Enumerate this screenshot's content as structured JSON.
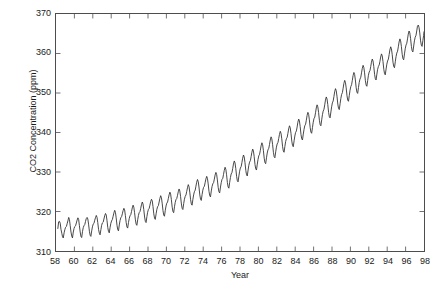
{
  "chart_data": {
    "type": "line",
    "title": "",
    "xlabel": "Year",
    "ylabel": "CO2 Concentration (ppm)",
    "xlim": [
      58,
      98
    ],
    "ylim": [
      310,
      370
    ],
    "xticks": [
      58,
      60,
      62,
      64,
      66,
      68,
      70,
      72,
      74,
      76,
      78,
      80,
      82,
      84,
      86,
      88,
      90,
      92,
      94,
      96,
      98
    ],
    "yticks": [
      310,
      320,
      330,
      340,
      350,
      360,
      370
    ],
    "grid": false,
    "legend": null,
    "line_color": "#333333",
    "line_width": 0.9,
    "series": [
      {
        "name": "CO2 Concentration",
        "x": [
          58.2,
          58.29,
          58.38,
          58.46,
          58.54,
          58.63,
          58.71,
          58.79,
          58.88,
          58.96,
          59.04,
          59.13,
          59.21,
          59.29,
          59.38,
          59.46,
          59.54,
          59.63,
          59.71,
          59.79,
          59.88,
          59.96,
          60.04,
          60.13,
          60.21,
          60.29,
          60.38,
          60.46,
          60.54,
          60.63,
          60.71,
          60.79,
          60.88,
          60.96,
          61.04,
          61.13,
          61.21,
          61.29,
          61.38,
          61.46,
          61.54,
          61.63,
          61.71,
          61.79,
          61.88,
          61.96,
          62.04,
          62.13,
          62.21,
          62.29,
          62.38,
          62.46,
          62.54,
          62.63,
          62.71,
          62.79,
          62.88,
          62.96,
          63.04,
          63.13,
          63.21,
          63.29,
          63.38,
          63.46,
          63.54,
          63.63,
          63.71,
          63.79,
          63.88,
          63.96,
          64.04,
          64.13,
          64.21,
          64.29,
          64.38,
          64.46,
          64.54,
          64.63,
          64.71,
          64.79,
          64.88,
          64.96,
          65.04,
          65.13,
          65.21,
          65.29,
          65.38,
          65.46,
          65.54,
          65.63,
          65.71,
          65.79,
          65.88,
          65.96,
          66.04,
          66.13,
          66.21,
          66.29,
          66.38,
          66.46,
          66.54,
          66.63,
          66.71,
          66.79,
          66.88,
          66.96,
          67.04,
          67.13,
          67.21,
          67.29,
          67.38,
          67.46,
          67.54,
          67.63,
          67.71,
          67.79,
          67.88,
          67.96,
          68.04,
          68.13,
          68.21,
          68.29,
          68.38,
          68.46,
          68.54,
          68.63,
          68.71,
          68.79,
          68.88,
          68.96,
          69.04,
          69.13,
          69.21,
          69.29,
          69.38,
          69.46,
          69.54,
          69.63,
          69.71,
          69.79,
          69.88,
          69.96,
          70.04,
          70.13,
          70.21,
          70.29,
          70.38,
          70.46,
          70.54,
          70.63,
          70.71,
          70.79,
          70.88,
          70.96,
          71.04,
          71.13,
          71.21,
          71.29,
          71.38,
          71.46,
          71.54,
          71.63,
          71.71,
          71.79,
          71.88,
          71.96,
          72.04,
          72.13,
          72.21,
          72.29,
          72.38,
          72.46,
          72.54,
          72.63,
          72.71,
          72.79,
          72.88,
          72.96,
          73.04,
          73.13,
          73.21,
          73.29,
          73.38,
          73.46,
          73.54,
          73.63,
          73.71,
          73.79,
          73.88,
          73.96,
          74.04,
          74.13,
          74.21,
          74.29,
          74.38,
          74.46,
          74.54,
          74.63,
          74.71,
          74.79,
          74.88,
          74.96,
          75.04,
          75.13,
          75.21,
          75.29,
          75.38,
          75.46,
          75.54,
          75.63,
          75.71,
          75.79,
          75.88,
          75.96,
          76.04,
          76.13,
          76.21,
          76.29,
          76.38,
          76.46,
          76.54,
          76.63,
          76.71,
          76.79,
          76.88,
          76.96,
          77.04,
          77.13,
          77.21,
          77.29,
          77.38,
          77.46,
          77.54,
          77.63,
          77.71,
          77.79,
          77.88,
          77.96,
          78.04,
          78.13,
          78.21,
          78.29,
          78.38,
          78.46,
          78.54,
          78.63,
          78.71,
          78.79,
          78.88,
          78.96,
          79.04,
          79.13,
          79.21,
          79.29,
          79.38,
          79.46,
          79.54,
          79.63,
          79.71,
          79.79,
          79.88,
          79.96,
          80.04,
          80.13,
          80.21,
          80.29,
          80.38,
          80.46,
          80.54,
          80.63,
          80.71,
          80.79,
          80.88,
          80.96,
          81.04,
          81.13,
          81.21,
          81.29,
          81.38,
          81.46,
          81.54,
          81.63,
          81.71,
          81.79,
          81.88,
          81.96,
          82.04,
          82.13,
          82.21,
          82.29,
          82.38,
          82.46,
          82.54,
          82.63,
          82.71,
          82.79,
          82.88,
          82.96,
          83.04,
          83.13,
          83.21,
          83.29,
          83.38,
          83.46,
          83.54,
          83.63,
          83.71,
          83.79,
          83.88,
          83.96,
          84.04,
          84.13,
          84.21,
          84.29,
          84.38,
          84.46,
          84.54,
          84.63,
          84.71,
          84.79,
          84.88,
          84.96,
          85.04,
          85.13,
          85.21,
          85.29,
          85.38,
          85.46,
          85.54,
          85.63,
          85.71,
          85.79,
          85.88,
          85.96,
          86.04,
          86.13,
          86.21,
          86.29,
          86.38,
          86.46,
          86.54,
          86.63,
          86.71,
          86.79,
          86.88,
          86.96,
          87.04,
          87.13,
          87.21,
          87.29,
          87.38,
          87.46,
          87.54,
          87.63,
          87.71,
          87.79,
          87.88,
          87.96,
          88.04,
          88.13,
          88.21,
          88.29,
          88.38,
          88.46,
          88.54,
          88.63,
          88.71,
          88.79,
          88.88,
          88.96,
          89.04,
          89.13,
          89.21,
          89.29,
          89.38,
          89.46,
          89.54,
          89.63,
          89.71,
          89.79,
          89.88,
          89.96,
          90.04,
          90.13,
          90.21,
          90.29,
          90.38,
          90.46,
          90.54,
          90.63,
          90.71,
          90.79,
          90.88,
          90.96,
          91.04,
          91.13,
          91.21,
          91.29,
          91.38,
          91.46,
          91.54,
          91.63,
          91.71,
          91.79,
          91.88,
          91.96,
          92.04,
          92.13,
          92.21,
          92.29,
          92.38,
          92.46,
          92.54,
          92.63,
          92.71,
          92.79,
          92.88,
          92.96,
          93.04,
          93.13,
          93.21,
          93.29,
          93.38,
          93.46,
          93.54,
          93.63,
          93.71,
          93.79,
          93.88,
          93.96,
          94.04,
          94.13,
          94.21,
          94.29,
          94.38,
          94.46,
          94.54,
          94.63,
          94.71,
          94.79,
          94.88,
          94.96,
          95.04,
          95.13,
          95.21,
          95.29,
          95.38,
          95.46,
          95.54,
          95.63,
          95.71,
          95.79,
          95.88,
          95.96,
          96.04,
          96.13,
          96.21,
          96.29,
          96.38,
          96.46,
          96.54,
          96.63,
          96.71,
          96.79,
          96.88,
          96.96,
          97.04,
          97.13,
          97.21,
          97.29,
          97.38,
          97.46,
          97.54,
          97.63,
          97.71,
          97.79,
          97.88,
          97.96,
          98.0
        ],
        "values": [
          315.7,
          317.4,
          317.5,
          317.0,
          315.5,
          314.5,
          313.6,
          313.3,
          314.6,
          315.4,
          316.0,
          316.2,
          316.9,
          317.6,
          318.5,
          318.0,
          316.5,
          314.8,
          313.8,
          313.3,
          314.8,
          315.7,
          316.2,
          316.4,
          317.1,
          317.8,
          318.4,
          318.0,
          316.5,
          314.8,
          313.7,
          313.4,
          314.9,
          315.9,
          316.4,
          316.7,
          317.5,
          318.2,
          318.5,
          318.1,
          316.8,
          315.0,
          314.0,
          313.7,
          315.1,
          316.1,
          316.8,
          317.0,
          317.8,
          318.4,
          319.0,
          318.5,
          317.2,
          315.4,
          314.5,
          314.1,
          315.4,
          316.5,
          317.1,
          317.3,
          318.1,
          318.9,
          319.5,
          319.1,
          317.8,
          315.9,
          314.9,
          314.6,
          316.0,
          317.0,
          317.6,
          318.0,
          318.8,
          319.6,
          320.3,
          319.8,
          318.4,
          316.5,
          315.4,
          315.1,
          316.6,
          317.7,
          318.4,
          318.7,
          319.4,
          320.2,
          320.8,
          320.4,
          319.0,
          317.2,
          316.1,
          315.8,
          317.2,
          318.2,
          318.9,
          319.2,
          320.0,
          320.9,
          321.6,
          321.1,
          319.7,
          317.9,
          316.8,
          316.5,
          317.9,
          319.0,
          319.7,
          320.0,
          320.8,
          321.7,
          322.4,
          321.9,
          320.5,
          318.6,
          317.5,
          317.2,
          318.7,
          319.8,
          320.5,
          320.8,
          321.6,
          322.5,
          323.1,
          322.7,
          321.3,
          319.4,
          318.3,
          318.0,
          319.4,
          320.5,
          321.2,
          321.5,
          322.4,
          323.3,
          324.0,
          323.5,
          322.1,
          320.2,
          319.1,
          318.8,
          320.3,
          321.4,
          322.1,
          322.4,
          323.3,
          324.2,
          324.9,
          324.4,
          323.0,
          321.1,
          320.0,
          319.7,
          321.2,
          322.3,
          323.0,
          323.3,
          324.1,
          325.0,
          325.7,
          325.2,
          323.8,
          321.9,
          320.8,
          320.5,
          322.0,
          323.1,
          323.8,
          324.2,
          325.1,
          326.0,
          326.8,
          326.3,
          324.9,
          323.0,
          321.9,
          321.6,
          323.1,
          324.2,
          325.0,
          325.4,
          326.4,
          327.4,
          328.1,
          327.6,
          326.2,
          324.2,
          323.1,
          322.8,
          324.3,
          325.4,
          326.1,
          326.4,
          327.3,
          328.2,
          328.9,
          328.4,
          327.0,
          325.1,
          324.0,
          323.7,
          325.2,
          326.3,
          327.0,
          327.3,
          328.2,
          329.2,
          329.9,
          329.4,
          328.0,
          326.1,
          325.0,
          324.7,
          326.2,
          327.3,
          328.1,
          328.4,
          329.4,
          330.4,
          331.2,
          330.7,
          329.3,
          327.3,
          326.2,
          325.9,
          327.4,
          328.6,
          329.5,
          329.9,
          330.9,
          332.0,
          332.8,
          332.3,
          330.9,
          328.9,
          327.8,
          327.5,
          329.0,
          330.2,
          331.0,
          331.4,
          332.4,
          333.5,
          334.3,
          333.8,
          332.4,
          330.4,
          329.3,
          329.0,
          330.5,
          331.7,
          332.5,
          332.9,
          333.9,
          335.0,
          335.8,
          335.3,
          333.9,
          331.9,
          330.8,
          330.5,
          332.0,
          333.2,
          334.1,
          334.5,
          335.5,
          336.6,
          337.4,
          336.9,
          335.5,
          333.5,
          332.4,
          332.1,
          333.6,
          334.8,
          335.6,
          336.0,
          337.0,
          338.1,
          338.9,
          338.4,
          337.0,
          335.0,
          333.9,
          333.6,
          335.1,
          336.3,
          337.1,
          337.5,
          338.5,
          339.5,
          340.3,
          339.8,
          338.4,
          336.4,
          335.3,
          335.0,
          336.5,
          337.7,
          338.4,
          338.8,
          339.8,
          340.9,
          341.7,
          341.2,
          339.8,
          337.8,
          336.7,
          336.4,
          337.9,
          339.1,
          340.0,
          340.4,
          341.4,
          342.6,
          343.4,
          342.9,
          341.5,
          339.5,
          338.4,
          338.1,
          339.6,
          340.8,
          341.7,
          342.1,
          343.1,
          344.3,
          345.1,
          344.6,
          343.2,
          341.2,
          340.1,
          339.8,
          341.3,
          342.6,
          343.5,
          343.9,
          345.0,
          346.2,
          347.0,
          346.5,
          345.1,
          343.1,
          342.0,
          341.7,
          343.2,
          344.5,
          345.4,
          345.9,
          347.0,
          348.2,
          349.0,
          348.5,
          347.1,
          345.1,
          344.0,
          343.7,
          345.2,
          346.5,
          347.5,
          348.0,
          349.1,
          350.3,
          351.1,
          350.6,
          349.2,
          347.2,
          346.1,
          345.8,
          347.3,
          348.6,
          349.6,
          350.1,
          351.2,
          352.4,
          353.2,
          352.7,
          351.3,
          349.3,
          348.2,
          347.9,
          349.4,
          350.7,
          351.6,
          352.1,
          353.2,
          354.4,
          355.2,
          354.7,
          353.3,
          351.3,
          350.2,
          349.9,
          351.4,
          352.7,
          353.5,
          354.0,
          355.1,
          356.2,
          357.0,
          356.5,
          355.1,
          353.1,
          352.0,
          351.7,
          353.2,
          354.5,
          355.3,
          355.7,
          356.7,
          357.8,
          358.6,
          358.1,
          356.7,
          354.7,
          353.6,
          353.3,
          354.8,
          356.0,
          356.7,
          357.1,
          358.0,
          359.1,
          359.9,
          359.4,
          358.0,
          356.0,
          354.9,
          354.6,
          356.1,
          357.3,
          358.1,
          358.6,
          359.7,
          360.9,
          361.7,
          361.2,
          359.8,
          357.8,
          356.7,
          356.4,
          357.9,
          359.2,
          360.1,
          360.6,
          361.7,
          362.9,
          363.7,
          363.2,
          361.8,
          359.8,
          358.7,
          358.4,
          359.9,
          361.2,
          362.1,
          362.6,
          363.7,
          364.9,
          365.7,
          365.2,
          363.8,
          361.8,
          360.7,
          360.4,
          361.9,
          363.2,
          364.1,
          364.6,
          365.7,
          366.9,
          367.2,
          366.6,
          365.2,
          363.2,
          362.1,
          361.8,
          363.3,
          364.6,
          365.5
        ]
      }
    ]
  }
}
